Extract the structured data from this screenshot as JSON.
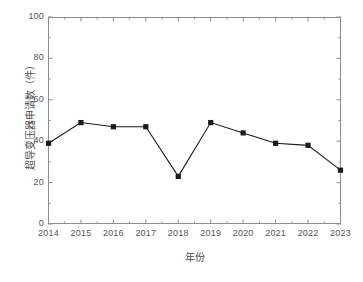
{
  "chart_data": {
    "type": "line",
    "title": "",
    "subtitle": "",
    "xlabel": "年份",
    "ylabel": "超导变压器申请数（件）",
    "categories": [
      "2014",
      "2015",
      "2016",
      "2017",
      "2018",
      "2019",
      "2020",
      "2021",
      "2022",
      "2023"
    ],
    "values": [
      39,
      49,
      47,
      47,
      23,
      49,
      44,
      39,
      38,
      26
    ],
    "series": [
      {
        "name": "超导变压器申请数",
        "values": [
          39,
          49,
          47,
          47,
          23,
          49,
          44,
          39,
          38,
          26
        ],
        "color": "#1a1a1a",
        "marker": "square",
        "line_style": "solid"
      }
    ],
    "ylim": [
      0,
      100
    ],
    "ytick_labels": [
      "0",
      "20",
      "40",
      "60",
      "80",
      "100"
    ],
    "ytick_values": [
      0,
      20,
      40,
      60,
      80,
      100
    ],
    "yminor_step": 10,
    "xtick_labels": [
      "2014",
      "2015",
      "2016",
      "2017",
      "2018",
      "2019",
      "2020",
      "2021",
      "2022",
      "2023"
    ],
    "grid": false,
    "legend": false,
    "legend_position": "none",
    "frame": "box",
    "tick_direction": "in",
    "axis_color": "#8d8d8d",
    "tick_label_color": "#555555",
    "axis_title_color": "#4a4a4a",
    "background_color": "#ffffff"
  }
}
